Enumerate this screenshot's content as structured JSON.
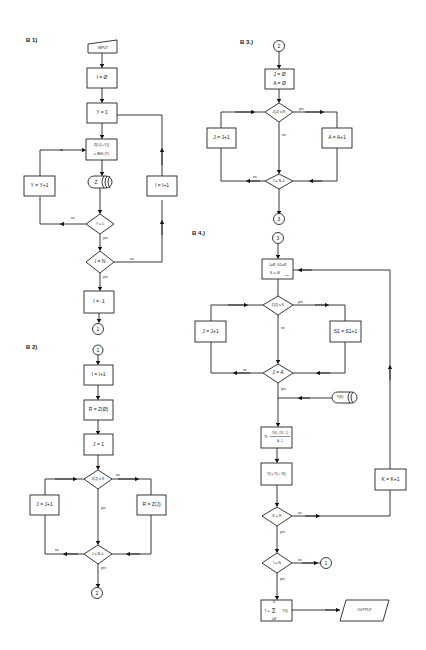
{
  "sections": {
    "b1": "B 1)",
    "b2": "B 2)",
    "b3": "B 3.)",
    "b4": "B 4.)"
  },
  "b1": {
    "input": "INPUT",
    "i_init": "I = Ø",
    "y_init": "Y = 1",
    "z_line1": "Z(I,(L+Y))",
    "z_line2": "= IMG (Y)",
    "z_store": "Z",
    "y_inc": "Y = Y+1",
    "i_inc": "I = I+1",
    "cond_y": "Y = L",
    "cond_i": "I = N",
    "i_reset": "I = -1",
    "connector_out": "1"
  },
  "b2": {
    "connector_in": "1",
    "i_inc": "I = I+1",
    "r_init": "R = Z(Ø)",
    "j_init": "J = 1",
    "cond": "Z(J) ≤ R",
    "j_inc": "J = J+1",
    "r_set": "R = Z(J)",
    "cond_j": "J = N+L",
    "connector_out": "2"
  },
  "b3": {
    "connector_in": "2",
    "init_line1": "J = Ø",
    "init_line2": "A = Ø",
    "cond": "Z(J) ≤ R",
    "j_inc": "J = J+1",
    "a_inc": "A = A+1",
    "cond_j": "J = N+L",
    "connector_out": "3"
  },
  "b4": {
    "connector_in": "3",
    "init_line1": "J=Ø, S1=Ø",
    "init_line2": "K = Gl",
    "init_sub": "min",
    "cond": "Z(J) ≤ K",
    "j_inc": "J = J+1",
    "s_inc": "S1 = S1+1",
    "cond_j": "J = A",
    "store": "T(K)",
    "calc_num": "T(K) - (S1 - 1)",
    "calc_den": "A - 1",
    "calc_prefix": "TK",
    "calc2": "T(I) = T(I) + T(K)",
    "k_inc": "K = K+1",
    "cond_k": "K = R",
    "cond_i": "I = N",
    "connector_1": "1",
    "sum_top": "N",
    "sum_prefix": "T =",
    "sum_body": "T(I)",
    "sum_bottom": "I=Ø",
    "output": "OUTPUT"
  },
  "labels": {
    "yes": "yes",
    "no": "no"
  }
}
